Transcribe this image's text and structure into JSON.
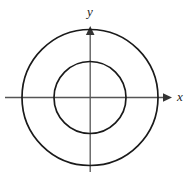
{
  "figure": {
    "kind": "coordinate-plane-with-concentric-circles",
    "background_color": "#ffffff",
    "width": 194,
    "height": 177
  },
  "chart_data": {
    "type": "scatter",
    "title": "",
    "subtitle": "",
    "xlabel": "x",
    "ylabel": "y",
    "grid": false,
    "legend": null,
    "origin": {
      "x": 90,
      "y": 97
    },
    "axes": [
      {
        "name": "x-axis",
        "label": "x",
        "orientation": "horizontal",
        "start_px": {
          "x": 5,
          "y": 97
        },
        "end_px": {
          "x": 172,
          "y": 97
        },
        "arrowhead": "end",
        "color": "#555555"
      },
      {
        "name": "y-axis",
        "label": "y",
        "orientation": "vertical",
        "start_px": {
          "x": 90,
          "y": 172
        },
        "end_px": {
          "x": 90,
          "y": 26
        },
        "arrowhead": "end",
        "color": "#555555"
      }
    ],
    "shapes": [
      {
        "name": "outer-circle",
        "type": "circle",
        "center": {
          "x": 90,
          "y": 97
        },
        "radius": 68,
        "stroke": "#1a1a1a",
        "stroke_width": 1.7,
        "fill": "none"
      },
      {
        "name": "inner-circle",
        "type": "circle",
        "center": {
          "x": 90,
          "y": 97
        },
        "radius": 36,
        "stroke": "#1a1a1a",
        "stroke_width": 1.7,
        "fill": "none"
      }
    ],
    "annotations": [
      {
        "name": "y-axis-label",
        "text": "y",
        "x": 90,
        "y": 11,
        "style": "italic-serif"
      },
      {
        "name": "x-axis-label",
        "text": "x",
        "x": 180,
        "y": 96,
        "style": "italic-serif"
      }
    ]
  },
  "labels": {
    "x_axis": "x",
    "y_axis": "y"
  },
  "colors": {
    "background": "#ffffff",
    "axis": "#555555",
    "curve": "#1a1a1a",
    "label": "#1a1a1a"
  }
}
